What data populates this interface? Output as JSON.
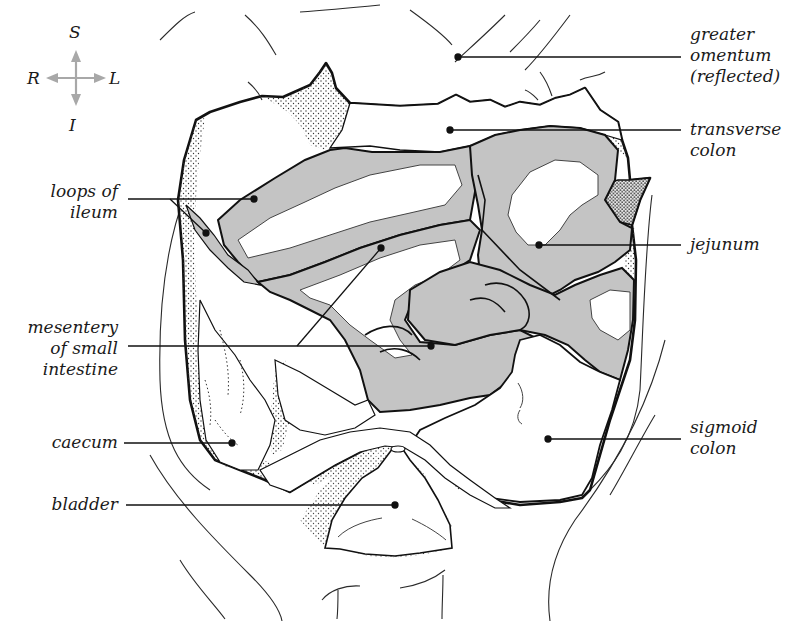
{
  "figure": {
    "colors": {
      "outline": "#111111",
      "thin_line": "#2a2a2a",
      "intestine_fill": "#c4c4c4",
      "background": "#ffffff",
      "compass_arrow": "#a8a8a8",
      "stipple": "#333333"
    }
  },
  "compass": {
    "superior": "S",
    "inferior": "I",
    "right": "R",
    "left": "L"
  },
  "labels": {
    "left": [
      {
        "id": "loops-of-ileum",
        "lines": [
          "loops of",
          "ileum"
        ]
      },
      {
        "id": "mesentery",
        "lines": [
          "mesentery",
          "of small",
          "intestine"
        ]
      },
      {
        "id": "caecum",
        "lines": [
          "caecum"
        ]
      },
      {
        "id": "bladder",
        "lines": [
          "bladder"
        ]
      }
    ],
    "right": [
      {
        "id": "greater-omentum",
        "lines": [
          "greater",
          "omentum",
          "(reflected)"
        ]
      },
      {
        "id": "transverse-colon",
        "lines": [
          "transverse",
          "colon"
        ]
      },
      {
        "id": "jejunum",
        "lines": [
          "jejunum"
        ]
      },
      {
        "id": "sigmoid-colon",
        "lines": [
          "sigmoid",
          "colon"
        ]
      }
    ]
  }
}
